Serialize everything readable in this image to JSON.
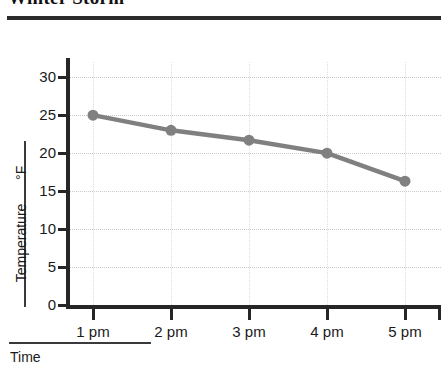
{
  "header": {
    "title": "Winter Storm",
    "title_clipped": true
  },
  "chart_data": {
    "type": "line",
    "title": "Winter Storm",
    "xlabel": "Time",
    "ylabel": "Temperature",
    "yunit": "°F",
    "categories": [
      "1 pm",
      "2 pm",
      "3 pm",
      "4 pm",
      "5 pm"
    ],
    "values": [
      25,
      23,
      21.7,
      20,
      16.3
    ],
    "series": [
      {
        "name": "Temperature",
        "values": [
          25,
          23,
          21.7,
          20,
          16.3
        ],
        "color": "#808080",
        "marker": "circle"
      }
    ],
    "ylim": [
      0,
      32
    ],
    "yticks": [
      0,
      5,
      10,
      15,
      20,
      25,
      30
    ],
    "ytick_labels": [
      "0",
      "5",
      "10",
      "15",
      "20",
      "25",
      "30"
    ],
    "xticks": [
      "1 pm",
      "2 pm",
      "3 pm",
      "4 pm",
      "5 pm"
    ],
    "grid": true,
    "grid_style": "dotted",
    "grid_color": "#c9c9c9",
    "legend": false,
    "line_color": "#808080",
    "axis_color": "#262626"
  }
}
